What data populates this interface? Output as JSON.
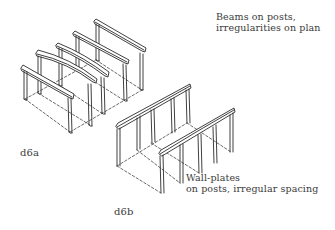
{
  "figure_a": {
    "tag": "d6a",
    "caption_line1": "Beams on posts,",
    "caption_line2": "irregularities on plan",
    "beams": [
      {
        "x1": 22,
        "y1": 68,
        "x2": 73,
        "y2": 98,
        "post_left": [
          25,
          70,
          99
        ],
        "post_right": [
          70,
          96,
          132
        ]
      },
      {
        "x1": 37,
        "y1": 53,
        "x2": 96,
        "y2": 82,
        "post_left": [
          38,
          56,
          93
        ],
        "post_right": [
          90,
          84,
          125
        ]
      },
      {
        "x1": 57,
        "y1": 45,
        "x2": 108,
        "y2": 76,
        "post_left": [
          59,
          48,
          85
        ],
        "post_right": [
          103,
          78,
          114
        ]
      },
      {
        "x1": 73,
        "y1": 33,
        "x2": 128,
        "y2": 63,
        "post_left": [
          76,
          36,
          70
        ],
        "post_right": [
          125,
          65,
          101
        ]
      },
      {
        "x1": 94,
        "y1": 21,
        "x2": 145,
        "y2": 51,
        "post_left": [
          96,
          24,
          60
        ],
        "post_right": [
          142,
          54,
          90
        ]
      }
    ]
  },
  "figure_b": {
    "tag": "d6b",
    "caption_line1": "Wall-plates",
    "caption_line2": "on posts, irregular spacing"
  },
  "colors": {
    "ink": "#2a2a2a",
    "text": "#3a3a3a",
    "background": "#ffffff"
  }
}
